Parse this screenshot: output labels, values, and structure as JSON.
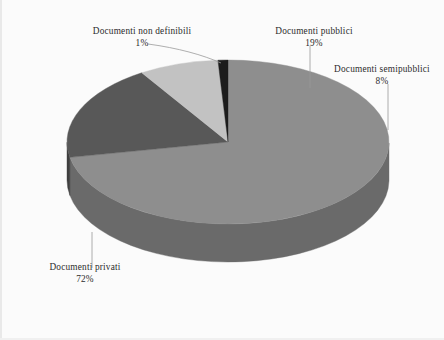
{
  "chart_data": {
    "type": "pie",
    "title": "",
    "subtitle": "",
    "xlabel": "",
    "ylabel": "",
    "legend_position": "none",
    "grid": false,
    "three_d": true,
    "categories": [
      "Documenti privati",
      "Documenti pubblici",
      "Documenti semipubblici",
      "Documenti non definibili"
    ],
    "values": [
      72,
      19,
      8,
      1
    ],
    "value_unit": "%",
    "slices": [
      {
        "label": "Documenti privati",
        "percent": 72,
        "percent_text": "72%",
        "color": "#8e8e8e",
        "side_color": "#6a6a6a"
      },
      {
        "label": "Documenti pubblici",
        "percent": 19,
        "percent_text": "19%",
        "color": "#585858",
        "side_color": "#3f3f3f"
      },
      {
        "label": "Documenti semipubblici",
        "percent": 8,
        "percent_text": "8%",
        "color": "#c2c2c2",
        "side_color": "#949494"
      },
      {
        "label": "Documenti non definibili",
        "percent": 1,
        "percent_text": "1%",
        "color": "#1c1c1c",
        "side_color": "#161616"
      }
    ]
  },
  "labels": {
    "non_definibili": {
      "name": "Documenti non definibili",
      "percent_text": "1%"
    },
    "pubblici": {
      "name": "Documenti pubblici",
      "percent_text": "19%"
    },
    "semipubblici": {
      "name": "Documenti semipubblici",
      "percent_text": "8%"
    },
    "privati": {
      "name": "Documenti privati",
      "percent_text": "72%"
    }
  },
  "colors": {
    "background": "#fbfbfb",
    "text": "#2b2b2b",
    "leader_line": "#9a9a9a",
    "privati": "#8e8e8e",
    "pubblici": "#585858",
    "semipubblici": "#c2c2c2",
    "non_definibili": "#1c1c1c"
  }
}
